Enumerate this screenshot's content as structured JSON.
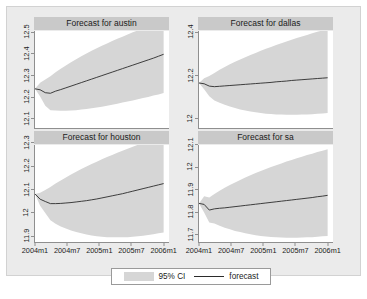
{
  "chart_data": {
    "type": "line",
    "title": "",
    "subtitle": "",
    "layout": "2x2 small-multiple panels",
    "xlabel": "",
    "ylabel": "",
    "grid": false,
    "legend": {
      "position": "bottom-center",
      "entries": [
        {
          "key": "ci-band",
          "label": "95% CI",
          "style": "filled-band",
          "color": "#d6d6d6"
        },
        {
          "key": "forecast-line",
          "label": "forecast",
          "style": "line",
          "color": "#2b2b2b"
        }
      ]
    },
    "x": {
      "ticks": [
        "2004m1",
        "2004m7",
        "2005m1",
        "2005m7",
        "2006m1"
      ],
      "tick_positions": [
        0.0,
        0.25,
        0.5,
        0.75,
        1.0
      ],
      "range": [
        "2003m11",
        "2006m1"
      ]
    },
    "panels": [
      {
        "id": "austin",
        "title": "Forecast for austin",
        "ylim": [
          12.05,
          12.55
        ],
        "yticks": [
          12.1,
          12.2,
          12.3,
          12.4,
          12.5
        ],
        "ytick_labels": [
          "12.1",
          "12.2",
          "12.3",
          "12.4",
          "12.5"
        ],
        "series": [
          {
            "name": "forecast",
            "values": [
              12.252,
              12.247,
              12.232,
              12.229,
              12.24,
              12.248,
              12.257,
              12.266,
              12.275,
              12.284,
              12.293,
              12.302,
              12.311,
              12.32,
              12.329,
              12.338,
              12.347,
              12.356,
              12.365,
              12.374,
              12.383,
              12.392,
              12.401,
              12.41,
              12.42,
              12.43
            ]
          },
          {
            "name": "ci_upper",
            "values": [
              12.252,
              12.283,
              12.3,
              12.317,
              12.337,
              12.355,
              12.372,
              12.389,
              12.405,
              12.42,
              12.434,
              12.448,
              12.461,
              12.474,
              12.486,
              12.498,
              12.51,
              12.521,
              12.532,
              12.543,
              12.553,
              12.563,
              12.573,
              12.583,
              12.592,
              12.601
            ]
          },
          {
            "name": "ci_lower",
            "values": [
              12.252,
              12.212,
              12.165,
              12.142,
              12.14,
              12.139,
              12.139,
              12.14,
              12.142,
              12.145,
              12.148,
              12.152,
              12.156,
              12.16,
              12.165,
              12.17,
              12.175,
              12.181,
              12.186,
              12.192,
              12.198,
              12.204,
              12.21,
              12.217,
              12.223,
              12.23
            ]
          }
        ]
      },
      {
        "id": "dallas",
        "title": "Forecast for dallas",
        "ylim": [
          11.95,
          12.45
        ],
        "yticks": [
          12.0,
          12.2,
          12.4
        ],
        "ytick_labels": [
          "12",
          "12.2",
          "12.4"
        ],
        "series": [
          {
            "name": "forecast",
            "values": [
              12.182,
              12.178,
              12.166,
              12.163,
              12.165,
              12.167,
              12.169,
              12.171,
              12.173,
              12.175,
              12.177,
              12.179,
              12.181,
              12.183,
              12.185,
              12.188,
              12.19,
              12.192,
              12.195,
              12.197,
              12.199,
              12.201,
              12.203,
              12.205,
              12.207,
              12.209
            ]
          },
          {
            "name": "ci_upper",
            "values": [
              12.182,
              12.206,
              12.218,
              12.234,
              12.25,
              12.264,
              12.278,
              12.291,
              12.303,
              12.315,
              12.326,
              12.337,
              12.348,
              12.358,
              12.368,
              12.378,
              12.387,
              12.396,
              12.405,
              12.414,
              12.422,
              12.43,
              12.438,
              12.446,
              12.453,
              12.46
            ]
          },
          {
            "name": "ci_lower",
            "values": [
              12.182,
              12.15,
              12.114,
              12.092,
              12.08,
              12.07,
              12.061,
              12.053,
              12.046,
              12.04,
              12.035,
              12.031,
              12.027,
              12.024,
              12.022,
              12.02,
              12.019,
              12.018,
              12.018,
              12.018,
              12.019,
              12.02,
              12.021,
              12.023,
              12.025,
              12.027
            ]
          }
        ]
      },
      {
        "id": "houston",
        "title": "Forecast for houston",
        "ylim": [
          11.87,
          12.33
        ],
        "yticks": [
          11.9,
          12.0,
          12.1,
          12.2,
          12.3
        ],
        "ytick_labels": [
          "11.9",
          "12",
          "12.1",
          "12.2",
          "12.3"
        ],
        "series": [
          {
            "name": "forecast",
            "values": [
              12.098,
              12.073,
              12.062,
              12.052,
              12.052,
              12.053,
              12.055,
              12.057,
              12.06,
              12.063,
              12.066,
              12.07,
              12.074,
              12.079,
              12.084,
              12.089,
              12.094,
              12.099,
              12.105,
              12.111,
              12.117,
              12.123,
              12.129,
              12.135,
              12.141,
              12.147
            ]
          },
          {
            "name": "ci_upper",
            "values": [
              12.098,
              12.104,
              12.116,
              12.131,
              12.147,
              12.162,
              12.176,
              12.19,
              12.203,
              12.216,
              12.228,
              12.24,
              12.251,
              12.262,
              12.273,
              12.283,
              12.293,
              12.303,
              12.312,
              12.322,
              12.331,
              12.34,
              12.348,
              12.357,
              12.365,
              12.373
            ]
          },
          {
            "name": "ci_lower",
            "values": [
              12.098,
              12.042,
              12.008,
              11.973,
              11.957,
              11.944,
              11.934,
              11.925,
              11.917,
              11.911,
              11.905,
              11.901,
              11.897,
              11.895,
              11.893,
              11.892,
              11.892,
              11.892,
              11.893,
              11.895,
              11.897,
              11.9,
              11.903,
              11.907,
              11.911,
              11.915
            ]
          }
        ]
      },
      {
        "id": "sa",
        "title": "Forecast for sa",
        "ylim": [
          11.66,
          12.14
        ],
        "yticks": [
          11.7,
          11.8,
          11.9,
          12.0,
          12.1
        ],
        "ytick_labels": [
          "11.7",
          "11.8",
          "11.9",
          "12",
          "12.1"
        ],
        "series": [
          {
            "name": "forecast",
            "values": [
              11.851,
              11.846,
              11.818,
              11.824,
              11.827,
              11.829,
              11.832,
              11.835,
              11.838,
              11.841,
              11.844,
              11.847,
              11.85,
              11.853,
              11.856,
              11.859,
              11.862,
              11.865,
              11.868,
              11.871,
              11.874,
              11.877,
              11.88,
              11.884,
              11.887,
              11.891
            ]
          },
          {
            "name": "ci_upper",
            "values": [
              11.851,
              11.886,
              11.88,
              11.897,
              11.913,
              11.928,
              11.942,
              11.955,
              11.967,
              11.979,
              11.99,
              12.001,
              12.011,
              12.021,
              12.031,
              12.04,
              12.049,
              12.058,
              12.066,
              12.074,
              12.082,
              12.09,
              12.097,
              12.105,
              12.112,
              12.119
            ]
          },
          {
            "name": "ci_lower",
            "values": [
              11.851,
              11.806,
              11.756,
              11.751,
              11.741,
              11.731,
              11.723,
              11.715,
              11.709,
              11.703,
              11.698,
              11.694,
              11.69,
              11.687,
              11.685,
              11.683,
              11.682,
              11.681,
              11.681,
              11.681,
              11.682,
              11.683,
              11.684,
              11.686,
              11.688,
              11.69
            ]
          }
        ]
      }
    ],
    "colors": {
      "ci_band": "#d6d6d6",
      "forecast_line": "#2b2b2b",
      "panel_title_bg": "#c9c9c9",
      "canvas_bg": "#ebebeb",
      "plot_bg": "#ffffff",
      "axis": "#8f8f8f"
    }
  }
}
